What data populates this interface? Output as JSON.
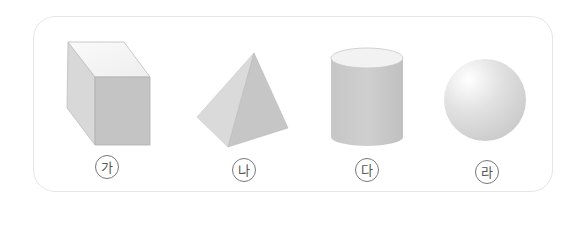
{
  "figure": {
    "shapes": [
      {
        "name": "rectangular-prism",
        "label": "가"
      },
      {
        "name": "pyramid",
        "label": "나"
      },
      {
        "name": "cylinder",
        "label": "다"
      },
      {
        "name": "sphere",
        "label": "라"
      }
    ]
  },
  "colors": {
    "frame_border": "#e6e6e6",
    "face_light": "#f4f4f4",
    "face_mid": "#cfcfcf",
    "face_dark": "#bdbdbd"
  }
}
